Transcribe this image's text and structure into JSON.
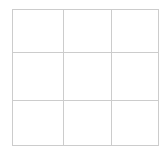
{
  "canvas": {
    "width": 165,
    "height": 150,
    "background_color": "#ffffff"
  },
  "grid": {
    "label": "3 by 3 grid",
    "rows": 3,
    "columns": 3,
    "line_color": "#cccccc",
    "line_width_px": 1,
    "origin_x_px": 12,
    "origin_y_px": 9,
    "total_width_px": 143,
    "total_height_px": 133,
    "column_widths_px": [
      50,
      47,
      46
    ],
    "row_heights_px": [
      42,
      47,
      44
    ],
    "column_divider_x_px": [
      62,
      109
    ],
    "row_divider_y_px": [
      51,
      98
    ],
    "cells": [
      [
        {
          "name": "cell-r1c1",
          "text": ""
        },
        {
          "name": "cell-r1c2",
          "text": ""
        },
        {
          "name": "cell-r1c3",
          "text": ""
        }
      ],
      [
        {
          "name": "cell-r2c1",
          "text": ""
        },
        {
          "name": "cell-r2c2",
          "text": ""
        },
        {
          "name": "cell-r2c3",
          "text": ""
        }
      ],
      [
        {
          "name": "cell-r3c1",
          "text": ""
        },
        {
          "name": "cell-r3c2",
          "text": ""
        },
        {
          "name": "cell-r3c3",
          "text": ""
        }
      ]
    ]
  }
}
